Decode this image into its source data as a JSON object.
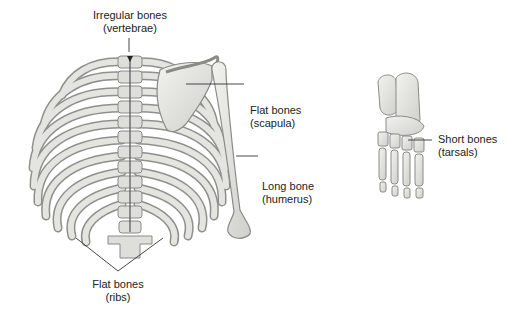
{
  "figure": {
    "labels": {
      "irregular": {
        "line1": "Irregular bones",
        "line2": "(vertebrae)"
      },
      "scapula": {
        "line1": "Flat bones",
        "line2": "(scapula)"
      },
      "humerus": {
        "line1": "Long bone",
        "line2": "(humerus)"
      },
      "tarsals": {
        "line1": "Short bones",
        "line2": "(tarsals)"
      },
      "ribs": {
        "line1": "Flat bones",
        "line2": "(ribs)"
      }
    },
    "colors": {
      "bone_fill": "#e6e6e3",
      "bone_stroke": "#8a8a86",
      "bone_shadow": "#b9b9b5",
      "leader": "#333333"
    }
  }
}
